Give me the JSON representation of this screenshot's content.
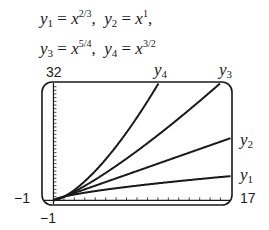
{
  "equations": {
    "line1": {
      "y1_label": "y",
      "y1_sub": "1",
      "y1_exp": "2/3",
      "y2_label": "y",
      "y2_sub": "2",
      "y2_exp": "1"
    },
    "line2": {
      "y3_label": "y",
      "y3_sub": "3",
      "y3_exp": "5/4",
      "y4_label": "y",
      "y4_sub": "4",
      "y4_exp": "3/2"
    }
  },
  "axis_labels": {
    "ymax": "32",
    "ymin": "−1",
    "xmin": "−1",
    "xmax": "17"
  },
  "curve_labels": {
    "y1": {
      "base": "y",
      "sub": "1"
    },
    "y2": {
      "base": "y",
      "sub": "2"
    },
    "y3": {
      "base": "y",
      "sub": "3"
    },
    "y4": {
      "base": "y",
      "sub": "4"
    }
  },
  "chart_data": {
    "type": "line",
    "xlabel": "",
    "ylabel": "",
    "xlim": [
      -1,
      17
    ],
    "ylim": [
      -1,
      32
    ],
    "x_tick_spacing": 1,
    "y_tick_spacing": 1,
    "grid": false,
    "legend": "inline labels at curve ends",
    "series": [
      {
        "name": "y1",
        "formula": "x^(2/3)",
        "x": [
          0,
          1,
          4,
          8,
          12,
          17
        ],
        "values": [
          0,
          1,
          2.52,
          4,
          5.24,
          6.61
        ]
      },
      {
        "name": "y2",
        "formula": "x^1",
        "x": [
          0,
          1,
          4,
          8,
          12,
          17
        ],
        "values": [
          0,
          1,
          4,
          8,
          12,
          17
        ]
      },
      {
        "name": "y3",
        "formula": "x^(5/4)",
        "x": [
          0,
          1,
          4,
          8,
          12,
          16
        ],
        "values": [
          0,
          1,
          5.66,
          13.45,
          22.3,
          32
        ]
      },
      {
        "name": "y4",
        "formula": "x^(3/2)",
        "x": [
          0,
          1,
          4,
          6,
          8,
          10.08
        ],
        "values": [
          0,
          1,
          8,
          14.7,
          22.6,
          32
        ]
      }
    ],
    "colors": {
      "curves": "#1a1a1a",
      "frame": "#1a1a1a"
    }
  }
}
